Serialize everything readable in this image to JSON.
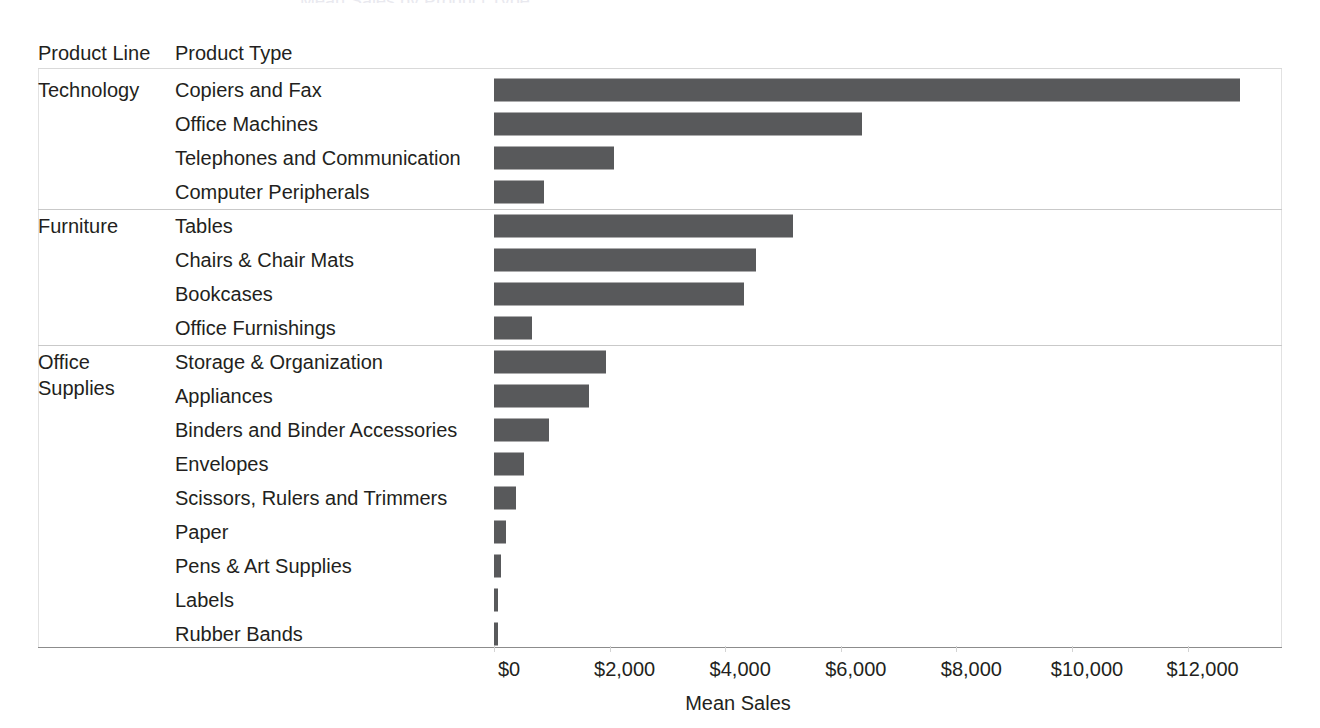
{
  "header": {
    "product_line_header": "Product Line",
    "product_type_header": "Product Type",
    "clipped_top_text": "Mean Sales by Product Type"
  },
  "axis": {
    "title": "Mean Sales",
    "tick_labels": [
      "$0",
      "$2,000",
      "$4,000",
      "$6,000",
      "$8,000",
      "$10,000",
      "$12,000"
    ],
    "tick_values": [
      0,
      2000,
      4000,
      6000,
      8000,
      10000,
      12000
    ]
  },
  "colors": {
    "bar": "#58595b",
    "text": "#231f20",
    "grid": "#d9d9d9",
    "axis": "#8c8c8c"
  },
  "groups": [
    {
      "label": "Technology",
      "row_count": 4
    },
    {
      "label": "Furniture",
      "row_count": 4
    },
    {
      "label": "Office\nSupplies",
      "row_count": 9
    }
  ],
  "chart_data": {
    "type": "bar",
    "orientation": "horizontal",
    "title": "",
    "xlabel": "Mean Sales",
    "ylabel": "Product Type",
    "xlim": [
      0,
      13600
    ],
    "grid": false,
    "legend": "none",
    "group_field": "Product Line",
    "category_field": "Product Type",
    "categories": [
      "Copiers and Fax",
      "Office Machines",
      "Telephones and Communication",
      "Computer Peripherals",
      "Tables",
      "Chairs & Chair Mats",
      "Bookcases",
      "Office Furnishings",
      "Storage & Organization",
      "Appliances",
      "Binders and Binder Accessories",
      "Envelopes",
      "Scissors, Rulers and Trimmers",
      "Paper",
      "Pens & Art Supplies",
      "Labels",
      "Rubber Bands"
    ],
    "values": [
      12900,
      6370,
      2070,
      860,
      5170,
      4530,
      4330,
      660,
      1930,
      1640,
      960,
      520,
      380,
      200,
      120,
      50,
      30
    ],
    "groups": [
      "Technology",
      "Technology",
      "Technology",
      "Technology",
      "Furniture",
      "Furniture",
      "Furniture",
      "Furniture",
      "Office Supplies",
      "Office Supplies",
      "Office Supplies",
      "Office Supplies",
      "Office Supplies",
      "Office Supplies",
      "Office Supplies",
      "Office Supplies",
      "Office Supplies"
    ]
  }
}
